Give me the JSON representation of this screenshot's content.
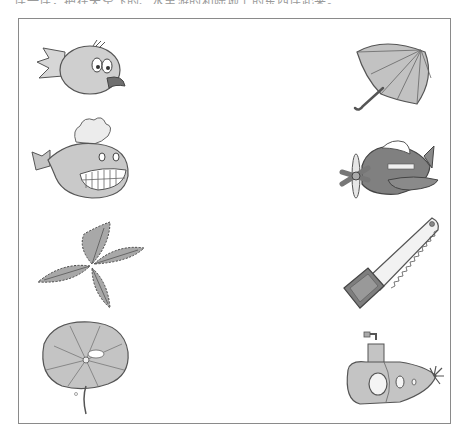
{
  "worksheet": {
    "instruction_text": "连一连，把在天空飞的、水里游的和陆地上的东西连起来。",
    "colors": {
      "fill": "#bdbdbd",
      "dark_fill": "#7a7a7a",
      "stroke": "#555555",
      "frame": "#8a8a8a"
    },
    "left_column": [
      {
        "name": "bird",
        "icon": "bird-icon"
      },
      {
        "name": "whale",
        "icon": "whale-icon"
      },
      {
        "name": "leaf",
        "icon": "leaf-icon"
      },
      {
        "name": "lotus-leaf",
        "icon": "lotus-leaf-icon"
      }
    ],
    "right_column": [
      {
        "name": "umbrella",
        "icon": "umbrella-icon"
      },
      {
        "name": "airplane",
        "icon": "airplane-icon"
      },
      {
        "name": "saw",
        "icon": "saw-icon"
      },
      {
        "name": "submarine",
        "icon": "submarine-icon"
      }
    ]
  }
}
